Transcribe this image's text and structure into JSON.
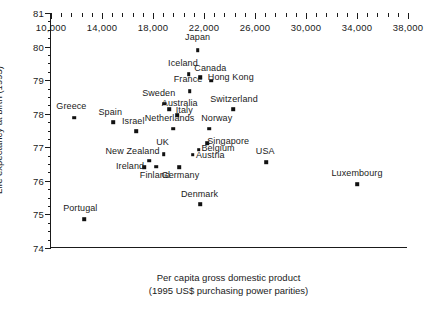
{
  "chart_data": {
    "type": "scatter",
    "title": "",
    "xlabel": "Per capita gross domestic product",
    "xlabel_line2": "(1995 US$ purchasing power parities)",
    "ylabel": "Life expectancy at birth (1995)",
    "xlim": [
      10000,
      38000
    ],
    "ylim": [
      74,
      81
    ],
    "xticks": [
      10000,
      14000,
      18000,
      22000,
      26000,
      30000,
      34000,
      38000
    ],
    "xtick_labels": [
      "10,000",
      "14,000",
      "18,000",
      "22,000",
      "26,000",
      "30,000",
      "34,000",
      "38,000"
    ],
    "xminor_step": 800,
    "yticks": [
      74,
      75,
      76,
      77,
      78,
      79,
      80,
      81
    ],
    "ytick_labels": [
      "74",
      "75",
      "76",
      "77",
      "78",
      "79",
      "80",
      "81"
    ],
    "yminor_step": 0.25,
    "grid": false,
    "legend": "none",
    "marker_color": "#111111",
    "axis_color": "#1a1a1a",
    "points": [
      {
        "label": "Japan",
        "x": 21500,
        "y": 79.9,
        "lx": 21500,
        "ly": 80.3
      },
      {
        "label": "Iceland",
        "x": 20800,
        "y": 79.17,
        "lx": 20350,
        "ly": 79.52
      },
      {
        "label": "Canada",
        "x": 21700,
        "y": 79.08,
        "lx": 22500,
        "ly": 79.35
      },
      {
        "label": "Hong Kong",
        "x": 22550,
        "y": 78.98,
        "lx": 24100,
        "ly": 79.1
      },
      {
        "label": "France",
        "x": 20880,
        "y": 78.67,
        "lx": 20750,
        "ly": 79.02
      },
      {
        "label": "Sweden",
        "x": 18900,
        "y": 78.3,
        "lx": 18450,
        "ly": 78.62
      },
      {
        "label": "Australia",
        "x": 19250,
        "y": 78.13,
        "lx": 20100,
        "ly": 78.33
      },
      {
        "label": "Switzerland",
        "x": 24300,
        "y": 78.13,
        "lx": 24350,
        "ly": 78.44
      },
      {
        "label": "Italy",
        "x": 19900,
        "y": 77.95,
        "lx": 20450,
        "ly": 78.12
      },
      {
        "label": "Greece",
        "x": 11800,
        "y": 77.88,
        "lx": 11600,
        "ly": 78.22
      },
      {
        "label": "Spain",
        "x": 14900,
        "y": 77.75,
        "lx": 14650,
        "ly": 78.05
      },
      {
        "label": "Netherlands",
        "x": 19600,
        "y": 77.55,
        "lx": 19300,
        "ly": 77.86
      },
      {
        "label": "Norway",
        "x": 22400,
        "y": 77.55,
        "lx": 23000,
        "ly": 77.88
      },
      {
        "label": "Israel",
        "x": 16700,
        "y": 77.48,
        "lx": 16450,
        "ly": 77.78
      },
      {
        "label": "Singapore",
        "x": 22250,
        "y": 77.12,
        "lx": 23900,
        "ly": 77.2
      },
      {
        "label": "UK",
        "x": 18850,
        "y": 76.8,
        "lx": 18750,
        "ly": 77.15
      },
      {
        "label": "Belgium",
        "x": 21600,
        "y": 76.93,
        "lx": 23100,
        "ly": 76.97
      },
      {
        "label": "Austria",
        "x": 21100,
        "y": 76.78,
        "lx": 22500,
        "ly": 76.78
      },
      {
        "label": "USA",
        "x": 26900,
        "y": 76.55,
        "lx": 26800,
        "ly": 76.9
      },
      {
        "label": "New Zealand",
        "x": 17700,
        "y": 76.6,
        "lx": 16400,
        "ly": 76.88
      },
      {
        "label": "Ireland",
        "x": 17300,
        "y": 76.4,
        "lx": 16200,
        "ly": 76.45
      },
      {
        "label": "Finland",
        "x": 18250,
        "y": 76.42,
        "lx": 18150,
        "ly": 76.16
      },
      {
        "label": "Germany",
        "x": 20050,
        "y": 76.4,
        "lx": 20150,
        "ly": 76.16
      },
      {
        "label": "Luxembourg",
        "x": 34000,
        "y": 75.9,
        "lx": 34000,
        "ly": 76.22
      },
      {
        "label": "Denmark",
        "x": 21700,
        "y": 75.3,
        "lx": 21650,
        "ly": 75.62
      },
      {
        "label": "Portugal",
        "x": 12600,
        "y": 74.85,
        "lx": 12300,
        "ly": 75.18
      }
    ]
  }
}
